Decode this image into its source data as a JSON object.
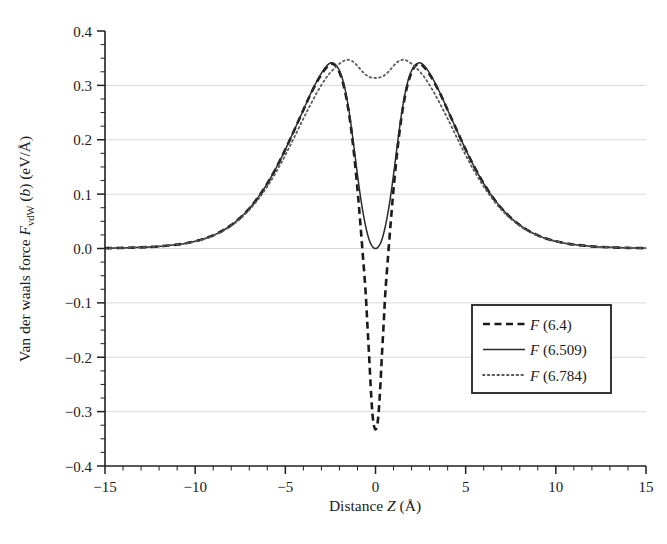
{
  "chart_data": {
    "type": "line",
    "title": "",
    "xlabel": "Distance Z (Å)",
    "ylabel": "Van der waals force F_vdW (b) (eV/Å)",
    "ylabel_parts": {
      "lead": "Van der waals force ",
      "f_italic": "F",
      "f_sub": "vdW",
      "mid": " (",
      "b_italic": "b",
      "tail": ") (eV/Å)"
    },
    "xlabel_parts": {
      "lead": "Distance ",
      "z_italic": "Z",
      "tail": " (Å)"
    },
    "xlim": [
      -15,
      15
    ],
    "ylim": [
      -0.4,
      0.4
    ],
    "xticks": [
      -15,
      -10,
      -5,
      0,
      5,
      10,
      15
    ],
    "xtick_labels": [
      "−15",
      "−10",
      "−5",
      "0",
      "5",
      "10",
      "15"
    ],
    "yticks": [
      -0.4,
      -0.3,
      -0.2,
      -0.1,
      0.0,
      0.1,
      0.2,
      0.3,
      0.4
    ],
    "ytick_labels": [
      "−0.4",
      "−0.3",
      "−0.2",
      "−0.1",
      "0.0",
      "0.1",
      "0.2",
      "0.3",
      "0.4"
    ],
    "x_minor_step": 1,
    "y_minor_step": 0.025,
    "grid": "horizontal",
    "grid_color": "#d8d8d8",
    "axis_color": "#231f20",
    "legend_position": "lower-right",
    "series": [
      {
        "name": "F (6.4)",
        "label_parts": {
          "f_italic": "F",
          "tail": " (6.4)"
        },
        "style": "dashed",
        "color": "#1a1a1a",
        "width": 2.6,
        "dash": "7,4.5",
        "points": [
          [
            -15.0,
            0.0006
          ],
          [
            -14.0,
            0.0011
          ],
          [
            -13.0,
            0.0021
          ],
          [
            -12.0,
            0.0039
          ],
          [
            -11.0,
            0.0072
          ],
          [
            -10.5,
            0.0098
          ],
          [
            -10.0,
            0.0133
          ],
          [
            -9.5,
            0.018
          ],
          [
            -9.0,
            0.0242
          ],
          [
            -8.5,
            0.0324
          ],
          [
            -8.0,
            0.043
          ],
          [
            -7.5,
            0.0565
          ],
          [
            -7.0,
            0.0735
          ],
          [
            -6.5,
            0.0944
          ],
          [
            -6.0,
            0.1195
          ],
          [
            -5.5,
            0.1488
          ],
          [
            -5.0,
            0.182
          ],
          [
            -4.5,
            0.218
          ],
          [
            -4.0,
            0.2548
          ],
          [
            -3.6,
            0.2838
          ],
          [
            -3.2,
            0.3093
          ],
          [
            -2.9,
            0.3252
          ],
          [
            -2.7,
            0.3335
          ],
          [
            -2.55,
            0.3385
          ],
          [
            -2.45,
            0.34
          ],
          [
            -2.35,
            0.3395
          ],
          [
            -2.2,
            0.3355
          ],
          [
            -2.0,
            0.324
          ],
          [
            -1.8,
            0.304
          ],
          [
            -1.6,
            0.274
          ],
          [
            -1.4,
            0.232
          ],
          [
            -1.2,
            0.177
          ],
          [
            -1.0,
            0.109
          ],
          [
            -0.85,
            0.05
          ],
          [
            -0.7,
            -0.013
          ],
          [
            -0.55,
            -0.079
          ],
          [
            -0.45,
            -0.14
          ],
          [
            -0.35,
            -0.2
          ],
          [
            -0.27,
            -0.252
          ],
          [
            -0.2,
            -0.29
          ],
          [
            -0.14,
            -0.314
          ],
          [
            -0.08,
            -0.327
          ],
          [
            0.0,
            -0.333
          ],
          [
            0.08,
            -0.327
          ],
          [
            0.14,
            -0.314
          ],
          [
            0.2,
            -0.29
          ],
          [
            0.27,
            -0.252
          ],
          [
            0.35,
            -0.2
          ],
          [
            0.45,
            -0.14
          ],
          [
            0.55,
            -0.079
          ],
          [
            0.7,
            -0.013
          ],
          [
            0.85,
            0.05
          ],
          [
            1.0,
            0.109
          ],
          [
            1.2,
            0.177
          ],
          [
            1.4,
            0.232
          ],
          [
            1.6,
            0.274
          ],
          [
            1.8,
            0.304
          ],
          [
            2.0,
            0.324
          ],
          [
            2.2,
            0.3355
          ],
          [
            2.35,
            0.3395
          ],
          [
            2.45,
            0.34
          ],
          [
            2.55,
            0.3385
          ],
          [
            2.7,
            0.3335
          ],
          [
            2.9,
            0.3252
          ],
          [
            3.2,
            0.3093
          ],
          [
            3.6,
            0.2838
          ],
          [
            4.0,
            0.2548
          ],
          [
            4.5,
            0.218
          ],
          [
            5.0,
            0.182
          ],
          [
            5.5,
            0.1488
          ],
          [
            6.0,
            0.1195
          ],
          [
            6.5,
            0.0944
          ],
          [
            7.0,
            0.0735
          ],
          [
            7.5,
            0.0565
          ],
          [
            8.0,
            0.043
          ],
          [
            8.5,
            0.0324
          ],
          [
            9.0,
            0.0242
          ],
          [
            9.5,
            0.018
          ],
          [
            10.0,
            0.0133
          ],
          [
            10.5,
            0.0098
          ],
          [
            11.0,
            0.0072
          ],
          [
            12.0,
            0.0039
          ],
          [
            13.0,
            0.0021
          ],
          [
            14.0,
            0.0011
          ],
          [
            15.0,
            0.0006
          ]
        ]
      },
      {
        "name": "F (6.509)",
        "label_parts": {
          "f_italic": "F",
          "tail": " (6.509)"
        },
        "style": "solid",
        "color": "#2b2b2b",
        "width": 1.5,
        "dash": "",
        "points": [
          [
            -15.0,
            0.0006
          ],
          [
            -14.0,
            0.0011
          ],
          [
            -13.0,
            0.0021
          ],
          [
            -12.0,
            0.0039
          ],
          [
            -11.0,
            0.0072
          ],
          [
            -10.5,
            0.0098
          ],
          [
            -10.0,
            0.0133
          ],
          [
            -9.5,
            0.018
          ],
          [
            -9.0,
            0.0242
          ],
          [
            -8.5,
            0.0324
          ],
          [
            -8.0,
            0.043
          ],
          [
            -7.5,
            0.0565
          ],
          [
            -7.0,
            0.0735
          ],
          [
            -6.5,
            0.0944
          ],
          [
            -6.0,
            0.1195
          ],
          [
            -5.5,
            0.1488
          ],
          [
            -5.0,
            0.182
          ],
          [
            -4.5,
            0.218
          ],
          [
            -4.0,
            0.2548
          ],
          [
            -3.6,
            0.2845
          ],
          [
            -3.2,
            0.311
          ],
          [
            -2.9,
            0.3275
          ],
          [
            -2.7,
            0.336
          ],
          [
            -2.55,
            0.3405
          ],
          [
            -2.45,
            0.3415
          ],
          [
            -2.3,
            0.34
          ],
          [
            -2.15,
            0.3355
          ],
          [
            -2.0,
            0.327
          ],
          [
            -1.85,
            0.314
          ],
          [
            -1.7,
            0.295
          ],
          [
            -1.55,
            0.269
          ],
          [
            -1.4,
            0.238
          ],
          [
            -1.25,
            0.201
          ],
          [
            -1.1,
            0.162
          ],
          [
            -0.95,
            0.123
          ],
          [
            -0.8,
            0.088
          ],
          [
            -0.65,
            0.058
          ],
          [
            -0.5,
            0.034
          ],
          [
            -0.38,
            0.019
          ],
          [
            -0.26,
            0.0085
          ],
          [
            -0.15,
            0.0028
          ],
          [
            -0.07,
            0.0005
          ],
          [
            0.0,
            0.0
          ],
          [
            0.07,
            0.0005
          ],
          [
            0.15,
            0.0028
          ],
          [
            0.26,
            0.0085
          ],
          [
            0.38,
            0.019
          ],
          [
            0.5,
            0.034
          ],
          [
            0.65,
            0.058
          ],
          [
            0.8,
            0.088
          ],
          [
            0.95,
            0.123
          ],
          [
            1.1,
            0.162
          ],
          [
            1.25,
            0.201
          ],
          [
            1.4,
            0.238
          ],
          [
            1.55,
            0.269
          ],
          [
            1.7,
            0.295
          ],
          [
            1.85,
            0.314
          ],
          [
            2.0,
            0.327
          ],
          [
            2.15,
            0.3355
          ],
          [
            2.3,
            0.34
          ],
          [
            2.45,
            0.3415
          ],
          [
            2.55,
            0.3405
          ],
          [
            2.7,
            0.336
          ],
          [
            2.9,
            0.3275
          ],
          [
            3.2,
            0.311
          ],
          [
            3.6,
            0.2845
          ],
          [
            4.0,
            0.2548
          ],
          [
            4.5,
            0.218
          ],
          [
            5.0,
            0.182
          ],
          [
            5.5,
            0.1488
          ],
          [
            6.0,
            0.1195
          ],
          [
            6.5,
            0.0944
          ],
          [
            7.0,
            0.0735
          ],
          [
            7.5,
            0.0565
          ],
          [
            8.0,
            0.043
          ],
          [
            8.5,
            0.0324
          ],
          [
            9.0,
            0.0242
          ],
          [
            9.5,
            0.018
          ],
          [
            10.0,
            0.0133
          ],
          [
            10.5,
            0.0098
          ],
          [
            11.0,
            0.0072
          ],
          [
            12.0,
            0.0039
          ],
          [
            13.0,
            0.0021
          ],
          [
            14.0,
            0.0011
          ],
          [
            15.0,
            0.0006
          ]
        ]
      },
      {
        "name": "F (6.784)",
        "label_parts": {
          "f_italic": "F",
          "tail": " (6.784)"
        },
        "style": "dotted",
        "color": "#5a5a5a",
        "width": 1.8,
        "dash": "1.6,3.2",
        "points": [
          [
            -15.0,
            0.0006
          ],
          [
            -14.0,
            0.0011
          ],
          [
            -13.0,
            0.0021
          ],
          [
            -12.0,
            0.0039
          ],
          [
            -11.0,
            0.0072
          ],
          [
            -10.5,
            0.0096
          ],
          [
            -10.0,
            0.013
          ],
          [
            -9.5,
            0.0175
          ],
          [
            -9.0,
            0.0235
          ],
          [
            -8.5,
            0.0314
          ],
          [
            -8.0,
            0.0416
          ],
          [
            -7.5,
            0.0546
          ],
          [
            -7.0,
            0.0708
          ],
          [
            -6.5,
            0.0905
          ],
          [
            -6.0,
            0.114
          ],
          [
            -5.5,
            0.1412
          ],
          [
            -5.0,
            0.1718
          ],
          [
            -4.5,
            0.2048
          ],
          [
            -4.0,
            0.2388
          ],
          [
            -3.6,
            0.2648
          ],
          [
            -3.2,
            0.2895
          ],
          [
            -2.8,
            0.3108
          ],
          [
            -2.5,
            0.3238
          ],
          [
            -2.2,
            0.334
          ],
          [
            -1.95,
            0.341
          ],
          [
            -1.75,
            0.3452
          ],
          [
            -1.6,
            0.347
          ],
          [
            -1.45,
            0.3468
          ],
          [
            -1.3,
            0.3448
          ],
          [
            -1.15,
            0.341
          ],
          [
            -1.0,
            0.3358
          ],
          [
            -0.85,
            0.33
          ],
          [
            -0.7,
            0.3245
          ],
          [
            -0.55,
            0.3198
          ],
          [
            -0.4,
            0.3165
          ],
          [
            -0.25,
            0.3146
          ],
          [
            -0.12,
            0.3138
          ],
          [
            0.0,
            0.3136
          ],
          [
            0.12,
            0.3138
          ],
          [
            0.25,
            0.3146
          ],
          [
            0.4,
            0.3165
          ],
          [
            0.55,
            0.3198
          ],
          [
            0.7,
            0.3245
          ],
          [
            0.85,
            0.33
          ],
          [
            1.0,
            0.3358
          ],
          [
            1.15,
            0.341
          ],
          [
            1.3,
            0.3448
          ],
          [
            1.45,
            0.3468
          ],
          [
            1.6,
            0.347
          ],
          [
            1.75,
            0.3452
          ],
          [
            1.95,
            0.341
          ],
          [
            2.2,
            0.334
          ],
          [
            2.5,
            0.3238
          ],
          [
            2.8,
            0.3108
          ],
          [
            3.2,
            0.2895
          ],
          [
            3.6,
            0.2648
          ],
          [
            4.0,
            0.2388
          ],
          [
            4.5,
            0.2048
          ],
          [
            5.0,
            0.1718
          ],
          [
            5.5,
            0.1412
          ],
          [
            6.0,
            0.114
          ],
          [
            6.5,
            0.0905
          ],
          [
            7.0,
            0.0708
          ],
          [
            7.5,
            0.0546
          ],
          [
            8.0,
            0.0416
          ],
          [
            8.5,
            0.0314
          ],
          [
            9.0,
            0.0235
          ],
          [
            9.5,
            0.0175
          ],
          [
            10.0,
            0.013
          ],
          [
            10.5,
            0.0096
          ],
          [
            11.0,
            0.0072
          ],
          [
            12.0,
            0.0039
          ],
          [
            13.0,
            0.0021
          ],
          [
            14.0,
            0.0011
          ],
          [
            15.0,
            0.0006
          ]
        ]
      }
    ]
  },
  "plot_geometry": {
    "left": 105,
    "right": 646,
    "top": 31,
    "bottom": 466
  }
}
